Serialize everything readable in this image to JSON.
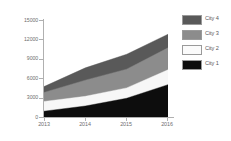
{
  "chart_data": {
    "type": "area",
    "stacked": true,
    "title": "",
    "subtitle": "",
    "xlabel": "",
    "ylabel": "",
    "categories": [
      "2013",
      "2014",
      "2015",
      "2016"
    ],
    "x": [
      2013,
      2014,
      2015,
      2016
    ],
    "ylim": [
      0,
      15000
    ],
    "yticks": [
      0,
      3000,
      6000,
      9000,
      12000,
      15000
    ],
    "ytick_labels": [
      "0",
      "3000",
      "6000",
      "9000",
      "12000",
      "15000"
    ],
    "xtick_labels": [
      "2013",
      "2014",
      "2015",
      "2016"
    ],
    "grid": false,
    "legend_position": "right",
    "series": [
      {
        "name": "City 1",
        "color": "#0d0d0d",
        "values": [
          900,
          1700,
          2900,
          5000
        ],
        "cumulative_top": [
          900,
          1700,
          2900,
          5000
        ]
      },
      {
        "name": "City 2",
        "color": "#f7f7f7",
        "values": [
          1500,
          1500,
          1600,
          2300
        ],
        "cumulative_top": [
          2400,
          3200,
          4500,
          7300
        ]
      },
      {
        "name": "City 3",
        "color": "#8c8c8c",
        "values": [
          1400,
          2500,
          2900,
          3400
        ],
        "cumulative_top": [
          3800,
          5700,
          7400,
          10700
        ]
      },
      {
        "name": "City 4",
        "color": "#595959",
        "values": [
          900,
          1900,
          2300,
          2100
        ],
        "cumulative_top": [
          4700,
          7600,
          9700,
          12800
        ]
      }
    ],
    "legend_entries": [
      "City 4",
      "City 3",
      "City 2",
      "City 1"
    ],
    "axis_color": "#b0b0b0",
    "tick_label_color": "#6e6e6e",
    "legend_text_color": "#58585a"
  },
  "legend": {
    "rows": [
      {
        "label": "City 4",
        "color": "#595959"
      },
      {
        "label": "City 3",
        "color": "#8c8c8c"
      },
      {
        "label": "City 2",
        "color": "#f7f7f7"
      },
      {
        "label": "City 1",
        "color": "#0d0d0d"
      }
    ]
  },
  "caption": {
    "text": ""
  }
}
